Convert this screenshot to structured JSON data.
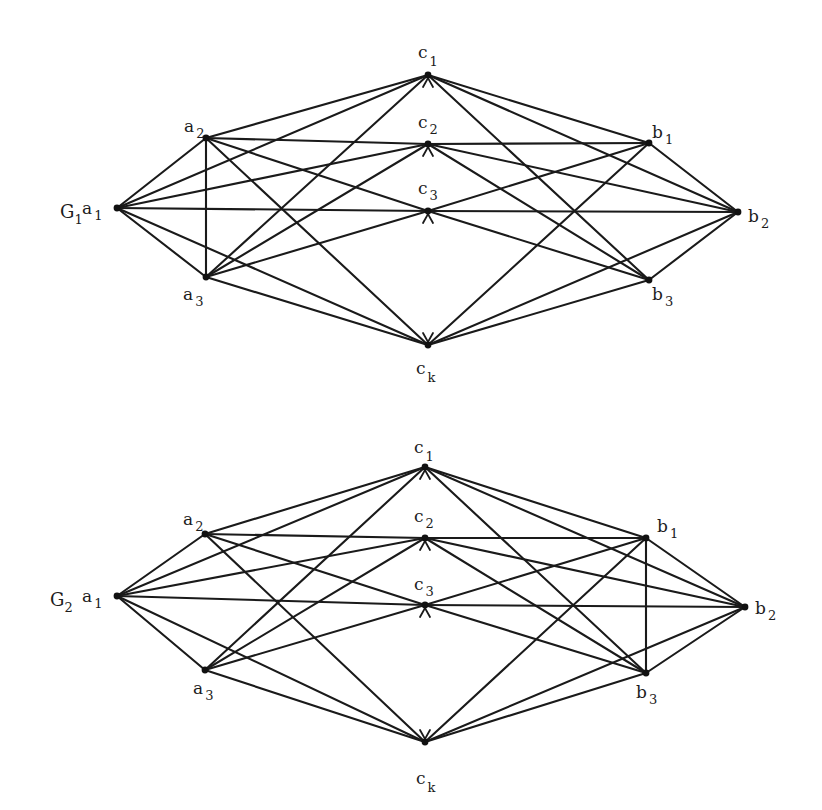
{
  "figure": {
    "ink_color": "#1a1a1a",
    "background_color": "#ffffff"
  },
  "graphs": [
    {
      "id": "G1",
      "label_main": "G",
      "label_sub": "1",
      "nodes": [
        {
          "id": "a1",
          "main": "a",
          "sub": "1"
        },
        {
          "id": "a2",
          "main": "a",
          "sub": "2"
        },
        {
          "id": "a3",
          "main": "a",
          "sub": "3"
        },
        {
          "id": "c1",
          "main": "c",
          "sub": "1"
        },
        {
          "id": "c2",
          "main": "c",
          "sub": "2"
        },
        {
          "id": "c3",
          "main": "c",
          "sub": "3"
        },
        {
          "id": "ck",
          "main": "c",
          "sub": "k"
        },
        {
          "id": "b1",
          "main": "b",
          "sub": "1"
        },
        {
          "id": "b2",
          "main": "b",
          "sub": "2"
        },
        {
          "id": "b3",
          "main": "b",
          "sub": "3"
        }
      ],
      "edges": [
        [
          "a1",
          "a2"
        ],
        [
          "a1",
          "a3"
        ],
        [
          "a2",
          "a3"
        ],
        [
          "a1",
          "c1"
        ],
        [
          "a1",
          "c2"
        ],
        [
          "a1",
          "c3"
        ],
        [
          "a1",
          "ck"
        ],
        [
          "a2",
          "c1"
        ],
        [
          "a2",
          "c2"
        ],
        [
          "a2",
          "c3"
        ],
        [
          "a2",
          "ck"
        ],
        [
          "a3",
          "c1"
        ],
        [
          "a3",
          "c2"
        ],
        [
          "a3",
          "c3"
        ],
        [
          "a3",
          "ck"
        ],
        [
          "b1",
          "c1"
        ],
        [
          "b1",
          "c2"
        ],
        [
          "b1",
          "c3"
        ],
        [
          "b1",
          "ck"
        ],
        [
          "b2",
          "c1"
        ],
        [
          "b2",
          "c2"
        ],
        [
          "b2",
          "c3"
        ],
        [
          "b2",
          "ck"
        ],
        [
          "b3",
          "c1"
        ],
        [
          "b3",
          "c2"
        ],
        [
          "b3",
          "c3"
        ],
        [
          "b3",
          "ck"
        ],
        [
          "b1",
          "b2"
        ],
        [
          "b2",
          "b3"
        ]
      ]
    },
    {
      "id": "G2",
      "label_main": "G",
      "label_sub": "2",
      "nodes": [
        {
          "id": "a1",
          "main": "a",
          "sub": "1"
        },
        {
          "id": "a2",
          "main": "a",
          "sub": "2"
        },
        {
          "id": "a3",
          "main": "a",
          "sub": "3"
        },
        {
          "id": "c1",
          "main": "c",
          "sub": "1"
        },
        {
          "id": "c2",
          "main": "c",
          "sub": "2"
        },
        {
          "id": "c3",
          "main": "c",
          "sub": "3"
        },
        {
          "id": "ck",
          "main": "c",
          "sub": "k"
        },
        {
          "id": "b1",
          "main": "b",
          "sub": "1"
        },
        {
          "id": "b2",
          "main": "b",
          "sub": "2"
        },
        {
          "id": "b3",
          "main": "b",
          "sub": "3"
        }
      ],
      "edges": [
        [
          "a1",
          "a2"
        ],
        [
          "a1",
          "a3"
        ],
        [
          "a1",
          "c1"
        ],
        [
          "a1",
          "c2"
        ],
        [
          "a1",
          "c3"
        ],
        [
          "a1",
          "ck"
        ],
        [
          "a2",
          "c1"
        ],
        [
          "a2",
          "c2"
        ],
        [
          "a2",
          "c3"
        ],
        [
          "a2",
          "ck"
        ],
        [
          "a3",
          "c1"
        ],
        [
          "a3",
          "c2"
        ],
        [
          "a3",
          "c3"
        ],
        [
          "a3",
          "ck"
        ],
        [
          "b1",
          "c1"
        ],
        [
          "b1",
          "c2"
        ],
        [
          "b1",
          "c3"
        ],
        [
          "b1",
          "ck"
        ],
        [
          "b2",
          "c1"
        ],
        [
          "b2",
          "c2"
        ],
        [
          "b2",
          "c3"
        ],
        [
          "b2",
          "ck"
        ],
        [
          "b3",
          "c1"
        ],
        [
          "b3",
          "c2"
        ],
        [
          "b3",
          "c3"
        ],
        [
          "b3",
          "ck"
        ],
        [
          "b1",
          "b2"
        ],
        [
          "b2",
          "b3"
        ],
        [
          "b1",
          "b3"
        ]
      ]
    }
  ]
}
